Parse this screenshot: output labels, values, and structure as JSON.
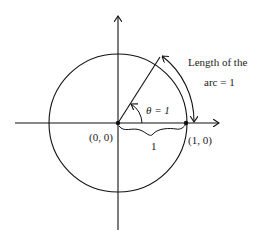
{
  "diagram": {
    "type": "unit-circle-radian",
    "origin_label": "(0, 0)",
    "point_label": "(1, 0)",
    "radius_label": "1",
    "angle_label": "θ = 1",
    "arc_label_line1": "Length of the",
    "arc_label_line2": "arc = 1",
    "colors": {
      "stroke": "#111111",
      "text": "#222222",
      "background": "#ffffff"
    }
  }
}
